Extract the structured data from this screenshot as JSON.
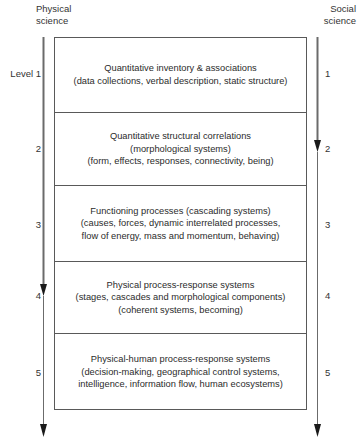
{
  "headers": {
    "left": "Physical\nscience",
    "right": "Social\nscience"
  },
  "levels": [
    {
      "left_label": "Level 1",
      "right_label": "1",
      "text": "Quantitative inventory & associations\n(data collections, verbal description, static structure)"
    },
    {
      "left_label": "2",
      "right_label": "2",
      "text": "Quantitative structural correlations\n(morphological systems)\n(form, effects, responses, connectivity, being)"
    },
    {
      "left_label": "3",
      "right_label": "3",
      "text": "Functioning processes (cascading systems)\n(causes, forces, dynamic interrelated processes,\nflow of energy, mass and momentum, behaving)"
    },
    {
      "left_label": "4",
      "right_label": "4",
      "text": "Physical process-response systems\n(stages, cascades and morphological components)\n(coherent systems, becoming)"
    },
    {
      "left_label": "5",
      "right_label": "5",
      "text": "Physical-human process-response systems\n(decision-making, geographical control systems,\nintelligence, information flow, human ecosystems)"
    }
  ],
  "axes": {
    "line_color": "#6b6b6b",
    "arrow_color": "#1a1a1a",
    "box_border_color": "#595959"
  }
}
